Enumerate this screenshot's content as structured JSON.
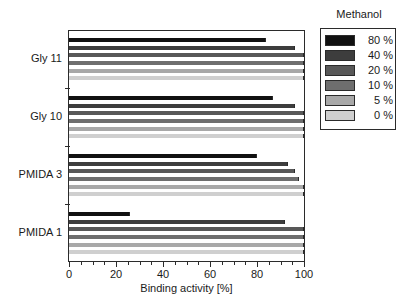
{
  "chart_data": {
    "type": "bar",
    "orientation": "horizontal",
    "title": "",
    "xlabel": "Binding activity [%]",
    "ylabel": "",
    "xlim": [
      0,
      100
    ],
    "xticks": [
      0,
      20,
      40,
      60,
      80,
      100
    ],
    "xtick_labels": [
      "0",
      "20",
      "40",
      "60",
      "80",
      "100"
    ],
    "minor_tick_interval": 5,
    "grid": false,
    "legend_title": "Methanol",
    "legend_position": "right-outside",
    "categories": [
      "PMIDA 1",
      "PMIDA 3",
      "Gly 10",
      "Gly 11"
    ],
    "categories_top_to_bottom": [
      "Gly 11",
      "Gly 10",
      "PMIDA 3",
      "PMIDA 1"
    ],
    "series": [
      {
        "name": "80 %",
        "color": "#111111",
        "values": [
          26,
          80,
          87,
          84
        ]
      },
      {
        "name": "40 %",
        "color": "#3d3d3d",
        "values": [
          92,
          93,
          96,
          96
        ]
      },
      {
        "name": "20 %",
        "color": "#585858",
        "values": [
          100,
          96,
          100,
          100
        ]
      },
      {
        "name": "10 %",
        "color": "#6e6e6e",
        "values": [
          100,
          98,
          100,
          100
        ]
      },
      {
        "name": "5 %",
        "color": "#a8a8a8",
        "values": [
          100,
          100,
          100,
          100
        ]
      },
      {
        "name": "0 %",
        "color": "#cfcfcf",
        "values": [
          100,
          100,
          100,
          100
        ]
      }
    ]
  },
  "legend": {
    "title": "Methanol",
    "items": [
      {
        "label": "80 %",
        "color": "#111111"
      },
      {
        "label": "40 %",
        "color": "#3d3d3d"
      },
      {
        "label": "20 %",
        "color": "#585858"
      },
      {
        "label": "10 %",
        "color": "#6e6e6e"
      },
      {
        "label": "5 %",
        "color": "#a8a8a8"
      },
      {
        "label": "0 %",
        "color": "#cfcfcf"
      }
    ]
  },
  "axes": {
    "x_title": "Binding activity [%]",
    "x_labels": [
      "0",
      "20",
      "40",
      "60",
      "80",
      "100"
    ],
    "y_labels": [
      "Gly 11",
      "Gly 10",
      "PMIDA 3",
      "PMIDA 1"
    ]
  }
}
